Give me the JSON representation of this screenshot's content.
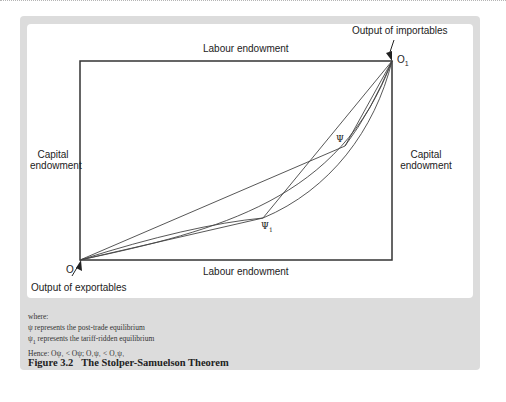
{
  "figure": {
    "number": "Figure 3.2",
    "title": "The Stolper-Samuelson Theorem"
  },
  "axes": {
    "top_label": "Labour endowment",
    "bottom_label": "Labour endowment",
    "left_label_line1": "Capital",
    "left_label_line2": "endowment",
    "right_label_line1": "Capital",
    "right_label_line2": "endowment"
  },
  "origins": {
    "bottom_left": "O",
    "top_right": "O",
    "top_right_subscript": "1",
    "bottom_left_annotation": "Output of exportables",
    "top_right_annotation": "Output of importables"
  },
  "points": {
    "psi": "Ψ",
    "psi1": "Ψ",
    "psi1_subscript": "1"
  },
  "notes": {
    "where": "where:",
    "line1_symbol": "ψ",
    "line1_text": " represents the post-trade equilibrium",
    "line2_symbol": "ψ",
    "line2_sub": "1",
    "line2_text": " represents the tariff-ridden equilibrium",
    "hence": "Hence: Oψ₁ < Oψ; O₁ψ₁ < O₁ψ₁"
  },
  "colors": {
    "panel_bg": "#dcdcdc",
    "inner_bg": "#ffffff",
    "line": "#333333"
  }
}
